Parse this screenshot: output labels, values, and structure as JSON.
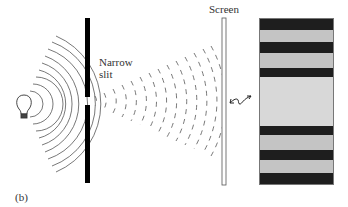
{
  "figure": {
    "panel_label": "(b)",
    "labels": {
      "slit": [
        "Narrow",
        "slit"
      ],
      "screen": "Screen"
    },
    "elements": {
      "light_source": "light-bulb-icon",
      "barrier": "barrier-with-narrow-slit",
      "screen": "screen",
      "link_arrow": "double-headed-wavy-arrow",
      "pattern": "diffraction-fringe-pattern"
    },
    "pattern_bands": [
      {
        "type": "dark",
        "top": 0,
        "height": 11
      },
      {
        "type": "light",
        "top": 11,
        "height": 12
      },
      {
        "type": "dark",
        "top": 23,
        "height": 11
      },
      {
        "type": "light",
        "top": 34,
        "height": 15
      },
      {
        "type": "dark",
        "top": 49,
        "height": 9
      },
      {
        "type": "central-bright",
        "top": 58,
        "height": 49
      },
      {
        "type": "dark",
        "top": 107,
        "height": 9
      },
      {
        "type": "light",
        "top": 116,
        "height": 15
      },
      {
        "type": "dark",
        "top": 131,
        "height": 10
      },
      {
        "type": "light",
        "top": 141,
        "height": 13
      },
      {
        "type": "dark",
        "top": 154,
        "height": 13
      }
    ],
    "colors": {
      "ink": "#000000",
      "wave": "#555555",
      "dark_band": "#1e1e1e",
      "light_band": "#c4c4c4",
      "central_band": "#d8d8d8"
    }
  }
}
